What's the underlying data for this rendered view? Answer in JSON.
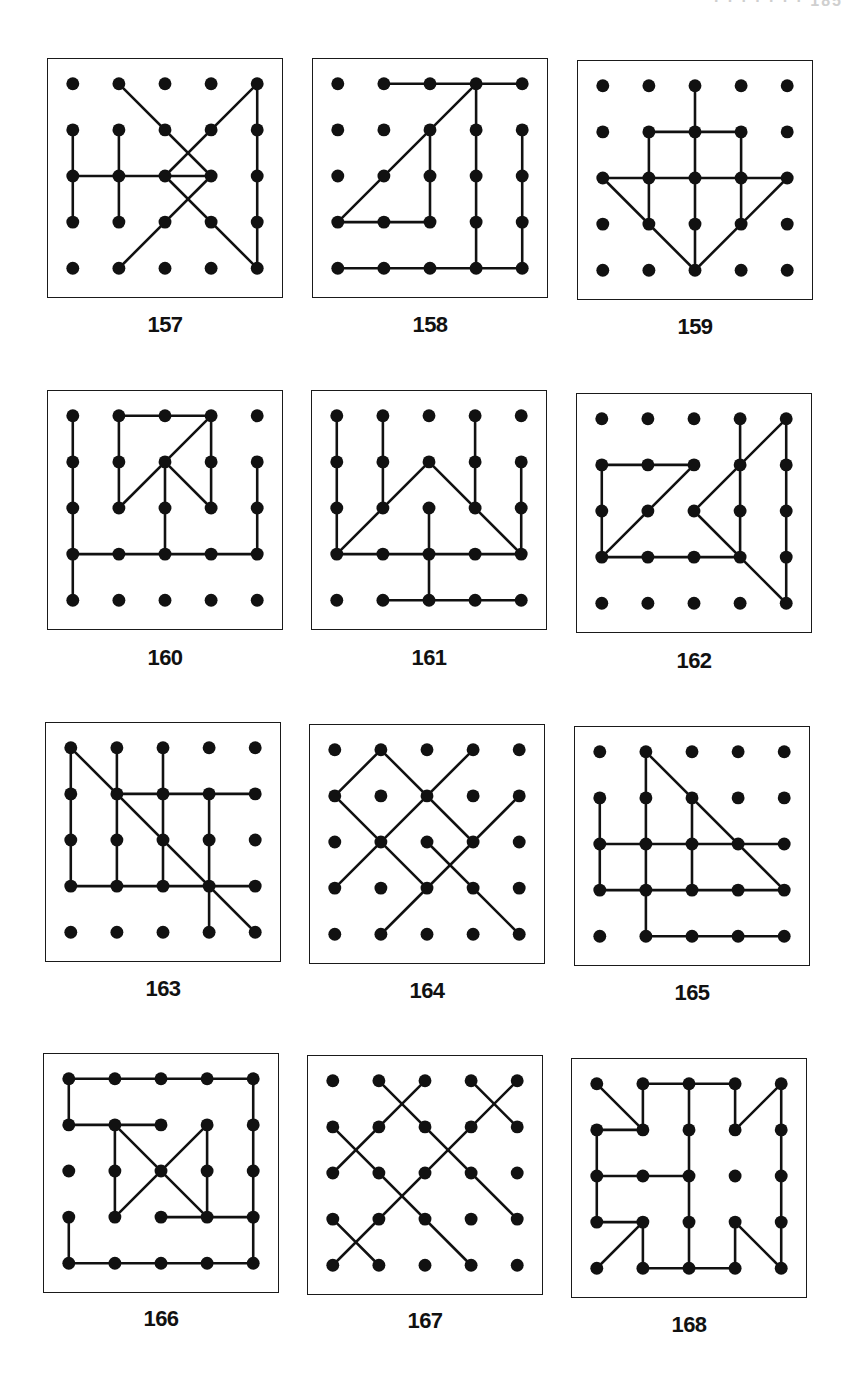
{
  "page": {
    "header_fragment": "· · · · · · · 185"
  },
  "grid": {
    "cols": 5,
    "rows": 5,
    "origin_px": 25,
    "spacing_px": 46.5,
    "dot_radius": 6.5,
    "line_width": 2.6,
    "color": "#111111"
  },
  "puzzles": [
    {
      "id": "157",
      "label": "157",
      "box": [
        47,
        58
      ],
      "label_y": 312,
      "segments": [
        [
          [
            1,
            0
          ],
          [
            3,
            2
          ]
        ],
        [
          [
            4,
            0
          ],
          [
            2,
            2
          ]
        ],
        [
          [
            4,
            0
          ],
          [
            4,
            4
          ]
        ],
        [
          [
            0,
            1
          ],
          [
            0,
            3
          ]
        ],
        [
          [
            1,
            1
          ],
          [
            1,
            3
          ]
        ],
        [
          [
            0,
            2
          ],
          [
            3,
            2
          ]
        ],
        [
          [
            3,
            2
          ],
          [
            1,
            4
          ]
        ],
        [
          [
            2,
            2
          ],
          [
            4,
            4
          ]
        ]
      ]
    },
    {
      "id": "158",
      "label": "158",
      "box": [
        312,
        58
      ],
      "label_y": 312,
      "segments": [
        [
          [
            1,
            0
          ],
          [
            4,
            0
          ]
        ],
        [
          [
            3,
            0
          ],
          [
            0,
            3
          ]
        ],
        [
          [
            3,
            0
          ],
          [
            3,
            4
          ]
        ],
        [
          [
            2,
            1
          ],
          [
            2,
            3
          ]
        ],
        [
          [
            0,
            3
          ],
          [
            2,
            3
          ]
        ],
        [
          [
            4,
            1
          ],
          [
            4,
            4
          ]
        ],
        [
          [
            0,
            4
          ],
          [
            4,
            4
          ]
        ]
      ]
    },
    {
      "id": "159",
      "label": "159",
      "box": [
        577,
        60
      ],
      "label_y": 314,
      "segments": [
        [
          [
            2,
            0
          ],
          [
            2,
            4
          ]
        ],
        [
          [
            1,
            1
          ],
          [
            3,
            1
          ]
        ],
        [
          [
            1,
            1
          ],
          [
            1,
            3
          ]
        ],
        [
          [
            3,
            1
          ],
          [
            3,
            3
          ]
        ],
        [
          [
            0,
            2
          ],
          [
            4,
            2
          ]
        ],
        [
          [
            0,
            2
          ],
          [
            2,
            4
          ]
        ],
        [
          [
            4,
            2
          ],
          [
            2,
            4
          ]
        ]
      ]
    },
    {
      "id": "160",
      "label": "160",
      "box": [
        47,
        390
      ],
      "label_y": 645,
      "segments": [
        [
          [
            0,
            0
          ],
          [
            0,
            4
          ]
        ],
        [
          [
            1,
            0
          ],
          [
            3,
            0
          ]
        ],
        [
          [
            1,
            0
          ],
          [
            1,
            2
          ]
        ],
        [
          [
            3,
            0
          ],
          [
            1,
            2
          ]
        ],
        [
          [
            3,
            0
          ],
          [
            3,
            2
          ]
        ],
        [
          [
            2,
            1
          ],
          [
            3,
            2
          ]
        ],
        [
          [
            2,
            1
          ],
          [
            2,
            3
          ]
        ],
        [
          [
            0,
            3
          ],
          [
            4,
            3
          ]
        ],
        [
          [
            4,
            1
          ],
          [
            4,
            3
          ]
        ]
      ]
    },
    {
      "id": "161",
      "label": "161",
      "box": [
        311,
        390
      ],
      "label_y": 645,
      "segments": [
        [
          [
            0,
            0
          ],
          [
            0,
            3
          ]
        ],
        [
          [
            1,
            0
          ],
          [
            1,
            2
          ]
        ],
        [
          [
            3,
            0
          ],
          [
            3,
            2
          ]
        ],
        [
          [
            0,
            3
          ],
          [
            2,
            1
          ]
        ],
        [
          [
            2,
            1
          ],
          [
            4,
            3
          ]
        ],
        [
          [
            4,
            1
          ],
          [
            4,
            3
          ]
        ],
        [
          [
            0,
            3
          ],
          [
            4,
            3
          ]
        ],
        [
          [
            2,
            2
          ],
          [
            2,
            4
          ]
        ],
        [
          [
            1,
            4
          ],
          [
            4,
            4
          ]
        ]
      ]
    },
    {
      "id": "162",
      "label": "162",
      "box": [
        576,
        393
      ],
      "label_y": 648,
      "segments": [
        [
          [
            0,
            1
          ],
          [
            2,
            1
          ]
        ],
        [
          [
            0,
            1
          ],
          [
            0,
            3
          ]
        ],
        [
          [
            2,
            1
          ],
          [
            0,
            3
          ]
        ],
        [
          [
            0,
            3
          ],
          [
            3,
            3
          ]
        ],
        [
          [
            3,
            0
          ],
          [
            3,
            3
          ]
        ],
        [
          [
            4,
            0
          ],
          [
            2,
            2
          ]
        ],
        [
          [
            2,
            2
          ],
          [
            4,
            4
          ]
        ],
        [
          [
            4,
            0
          ],
          [
            4,
            4
          ]
        ]
      ]
    },
    {
      "id": "163",
      "label": "163",
      "box": [
        45,
        722
      ],
      "label_y": 976,
      "segments": [
        [
          [
            0,
            0
          ],
          [
            4,
            4
          ]
        ],
        [
          [
            0,
            0
          ],
          [
            0,
            3
          ]
        ],
        [
          [
            1,
            0
          ],
          [
            1,
            3
          ]
        ],
        [
          [
            2,
            0
          ],
          [
            2,
            3
          ]
        ],
        [
          [
            1,
            1
          ],
          [
            4,
            1
          ]
        ],
        [
          [
            3,
            1
          ],
          [
            3,
            4
          ]
        ],
        [
          [
            0,
            3
          ],
          [
            4,
            3
          ]
        ]
      ]
    },
    {
      "id": "164",
      "label": "164",
      "box": [
        309,
        724
      ],
      "label_y": 978,
      "segments": [
        [
          [
            1,
            0
          ],
          [
            0,
            1
          ]
        ],
        [
          [
            1,
            0
          ],
          [
            3,
            2
          ]
        ],
        [
          [
            3,
            0
          ],
          [
            0,
            3
          ]
        ],
        [
          [
            0,
            1
          ],
          [
            2,
            3
          ]
        ],
        [
          [
            4,
            1
          ],
          [
            1,
            4
          ]
        ],
        [
          [
            2,
            2
          ],
          [
            4,
            4
          ]
        ]
      ]
    },
    {
      "id": "165",
      "label": "165",
      "box": [
        574,
        726
      ],
      "label_y": 980,
      "segments": [
        [
          [
            1,
            0
          ],
          [
            4,
            3
          ]
        ],
        [
          [
            1,
            0
          ],
          [
            1,
            4
          ]
        ],
        [
          [
            0,
            1
          ],
          [
            0,
            3
          ]
        ],
        [
          [
            2,
            1
          ],
          [
            2,
            3
          ]
        ],
        [
          [
            0,
            2
          ],
          [
            4,
            2
          ]
        ],
        [
          [
            0,
            3
          ],
          [
            4,
            3
          ]
        ],
        [
          [
            1,
            4
          ],
          [
            4,
            4
          ]
        ]
      ]
    },
    {
      "id": "166",
      "label": "166",
      "box": [
        43,
        1053
      ],
      "label_y": 1306,
      "segments": [
        [
          [
            0,
            0
          ],
          [
            4,
            0
          ]
        ],
        [
          [
            0,
            0
          ],
          [
            0,
            1
          ]
        ],
        [
          [
            0,
            1
          ],
          [
            2,
            1
          ]
        ],
        [
          [
            4,
            0
          ],
          [
            4,
            4
          ]
        ],
        [
          [
            1,
            1
          ],
          [
            1,
            3
          ]
        ],
        [
          [
            1,
            1
          ],
          [
            3,
            3
          ]
        ],
        [
          [
            3,
            1
          ],
          [
            1,
            3
          ]
        ],
        [
          [
            3,
            1
          ],
          [
            3,
            3
          ]
        ],
        [
          [
            2,
            3
          ],
          [
            4,
            3
          ]
        ],
        [
          [
            0,
            3
          ],
          [
            0,
            4
          ]
        ],
        [
          [
            0,
            4
          ],
          [
            4,
            4
          ]
        ]
      ]
    },
    {
      "id": "167",
      "label": "167",
      "box": [
        307,
        1055
      ],
      "label_y": 1308,
      "segments": [
        [
          [
            1,
            0
          ],
          [
            4,
            3
          ]
        ],
        [
          [
            2,
            0
          ],
          [
            0,
            2
          ]
        ],
        [
          [
            3,
            0
          ],
          [
            4,
            1
          ]
        ],
        [
          [
            4,
            0
          ],
          [
            0,
            4
          ]
        ],
        [
          [
            0,
            1
          ],
          [
            3,
            4
          ]
        ],
        [
          [
            0,
            3
          ],
          [
            1,
            4
          ]
        ]
      ]
    },
    {
      "id": "168",
      "label": "168",
      "box": [
        571,
        1058
      ],
      "label_y": 1312,
      "segments": [
        [
          [
            0,
            0
          ],
          [
            1,
            1
          ]
        ],
        [
          [
            1,
            0
          ],
          [
            3,
            0
          ]
        ],
        [
          [
            1,
            0
          ],
          [
            1,
            1
          ]
        ],
        [
          [
            0,
            1
          ],
          [
            1,
            1
          ]
        ],
        [
          [
            0,
            1
          ],
          [
            0,
            3
          ]
        ],
        [
          [
            2,
            0
          ],
          [
            2,
            4
          ]
        ],
        [
          [
            0,
            2
          ],
          [
            2,
            2
          ]
        ],
        [
          [
            3,
            0
          ],
          [
            3,
            1
          ]
        ],
        [
          [
            3,
            1
          ],
          [
            4,
            0
          ]
        ],
        [
          [
            4,
            0
          ],
          [
            4,
            4
          ]
        ],
        [
          [
            0,
            3
          ],
          [
            1,
            3
          ]
        ],
        [
          [
            1,
            3
          ],
          [
            0,
            4
          ]
        ],
        [
          [
            1,
            3
          ],
          [
            1,
            4
          ]
        ],
        [
          [
            1,
            4
          ],
          [
            3,
            4
          ]
        ],
        [
          [
            3,
            3
          ],
          [
            3,
            4
          ]
        ],
        [
          [
            3,
            3
          ],
          [
            4,
            4
          ]
        ]
      ]
    }
  ]
}
